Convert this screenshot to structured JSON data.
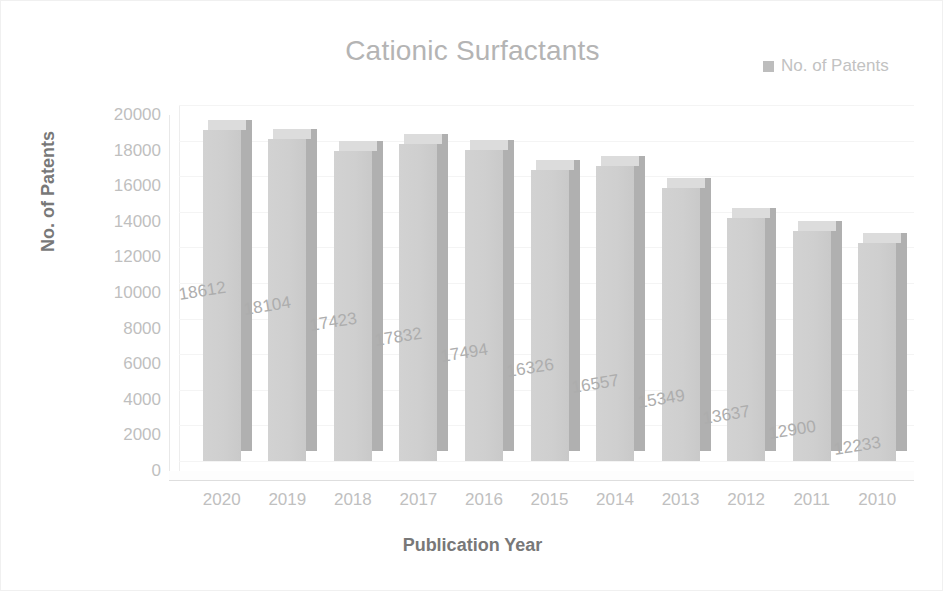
{
  "chart": {
    "title": "Cationic Surfactants",
    "x_axis_title": "Publication Year",
    "y_axis_title": "No. of Patents",
    "legend": {
      "label": "No. of Patents",
      "swatch_icon": "legend-square-icon",
      "color": "#bdbdbd"
    },
    "colors": {
      "bar_front": "#cfcfcf",
      "bar_side": "#b0b0b0",
      "bar_top": "#dcdcdc",
      "title_text": "#b4b4b4",
      "axis_title_text": "#787878",
      "tick_text": "#bfbfbf",
      "data_label_text": "#adadad",
      "gridline": "#f4f4f4",
      "background": "#ffffff"
    }
  },
  "chart_data": {
    "type": "bar",
    "title": "Cationic Surfactants",
    "xlabel": "Publication Year",
    "ylabel": "No. of Patents",
    "categories": [
      "2020",
      "2019",
      "2018",
      "2017",
      "2016",
      "2015",
      "2014",
      "2013",
      "2012",
      "2011",
      "2010"
    ],
    "values": [
      18612,
      18104,
      17423,
      17832,
      17494,
      16326,
      16557,
      15349,
      13637,
      12900,
      12233
    ],
    "series": [
      {
        "name": "No. of Patents",
        "values": [
          18612,
          18104,
          17423,
          17832,
          17494,
          16326,
          16557,
          15349,
          13637,
          12900,
          12233
        ]
      }
    ],
    "ylim": [
      0,
      20000
    ],
    "y_ticks": [
      "0",
      "2000",
      "4000",
      "6000",
      "8000",
      "10000",
      "12000",
      "14000",
      "16000",
      "18000",
      "20000"
    ],
    "y_tick_values": [
      0,
      2000,
      4000,
      6000,
      8000,
      10000,
      12000,
      14000,
      16000,
      18000,
      20000
    ],
    "data_labels": [
      "18612",
      "18104",
      "17423",
      "17832",
      "17494",
      "16326",
      "16557",
      "15349",
      "13637",
      "12900",
      "12233"
    ],
    "grid": true,
    "legend_position": "top-right",
    "three_d": true
  }
}
